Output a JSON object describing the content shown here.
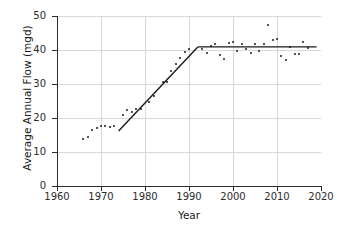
{
  "chart_data": {
    "type": "scatter",
    "title": "",
    "xlabel": "Year",
    "ylabel": "Average Annual Flow (mgd)",
    "xlim": [
      1960,
      2020
    ],
    "ylim": [
      0,
      50
    ],
    "xticks": [
      1960,
      1970,
      1980,
      1990,
      2000,
      2010,
      2020
    ],
    "yticks": [
      0,
      10,
      20,
      30,
      40,
      50
    ],
    "grid": true,
    "legend": "none",
    "series": [
      {
        "name": "Average Annual Flow",
        "marker": "dot",
        "color": "#1a1a1a",
        "points": [
          {
            "x": 1966,
            "y": 13.9
          },
          {
            "x": 1967,
            "y": 14.4
          },
          {
            "x": 1968,
            "y": 16.6
          },
          {
            "x": 1969,
            "y": 17.2
          },
          {
            "x": 1970,
            "y": 17.7
          },
          {
            "x": 1971,
            "y": 17.7
          },
          {
            "x": 1972,
            "y": 17.3
          },
          {
            "x": 1973,
            "y": 17.6
          },
          {
            "x": 1975,
            "y": 21.0
          },
          {
            "x": 1976,
            "y": 22.5
          },
          {
            "x": 1977,
            "y": 21.7
          },
          {
            "x": 1978,
            "y": 22.6
          },
          {
            "x": 1979,
            "y": 22.7
          },
          {
            "x": 1981,
            "y": 24.6
          },
          {
            "x": 1982,
            "y": 26.4
          },
          {
            "x": 1984,
            "y": 30.6
          },
          {
            "x": 1985,
            "y": 30.5
          },
          {
            "x": 1986,
            "y": 33.7
          },
          {
            "x": 1987,
            "y": 35.9
          },
          {
            "x": 1988,
            "y": 37.7
          },
          {
            "x": 1989,
            "y": 39.4
          },
          {
            "x": 1990,
            "y": 40.2
          },
          {
            "x": 1993,
            "y": 40.3
          },
          {
            "x": 1994,
            "y": 39.1
          },
          {
            "x": 1995,
            "y": 41.2
          },
          {
            "x": 1996,
            "y": 41.9
          },
          {
            "x": 1997,
            "y": 38.5
          },
          {
            "x": 1998,
            "y": 37.4
          },
          {
            "x": 1999,
            "y": 42.1
          },
          {
            "x": 2000,
            "y": 42.3
          },
          {
            "x": 2001,
            "y": 39.6
          },
          {
            "x": 2002,
            "y": 41.9
          },
          {
            "x": 2003,
            "y": 40.4
          },
          {
            "x": 2004,
            "y": 39.2
          },
          {
            "x": 2005,
            "y": 41.7
          },
          {
            "x": 2006,
            "y": 39.6
          },
          {
            "x": 2007,
            "y": 41.8
          },
          {
            "x": 2008,
            "y": 47.5
          },
          {
            "x": 2009,
            "y": 42.8
          },
          {
            "x": 2010,
            "y": 43.1
          },
          {
            "x": 2011,
            "y": 38.1
          },
          {
            "x": 2012,
            "y": 37.1
          },
          {
            "x": 2013,
            "y": 41.0
          },
          {
            "x": 2014,
            "y": 38.8
          },
          {
            "x": 2015,
            "y": 38.8
          },
          {
            "x": 2016,
            "y": 42.3
          },
          {
            "x": 2017,
            "y": 40.6
          }
        ]
      }
    ],
    "fit_lines": [
      {
        "name": "rising-segment",
        "color": "#1a1a1a",
        "points": [
          {
            "x": 1974.0,
            "y": 16.2
          },
          {
            "x": 1992.0,
            "y": 40.9
          }
        ]
      },
      {
        "name": "plateau-segment",
        "color": "#1a1a1a",
        "points": [
          {
            "x": 1992.0,
            "y": 40.9
          },
          {
            "x": 2019.0,
            "y": 40.9
          }
        ]
      }
    ]
  },
  "axes": {
    "ylabels": [
      "50",
      "40",
      "30",
      "20",
      "10",
      "0"
    ],
    "xlabels": [
      "1960",
      "1970",
      "1980",
      "1990",
      "2000",
      "2010",
      "2020"
    ],
    "ytitle": "Average Annual Flow (mgd)",
    "xtitle": "Year"
  }
}
